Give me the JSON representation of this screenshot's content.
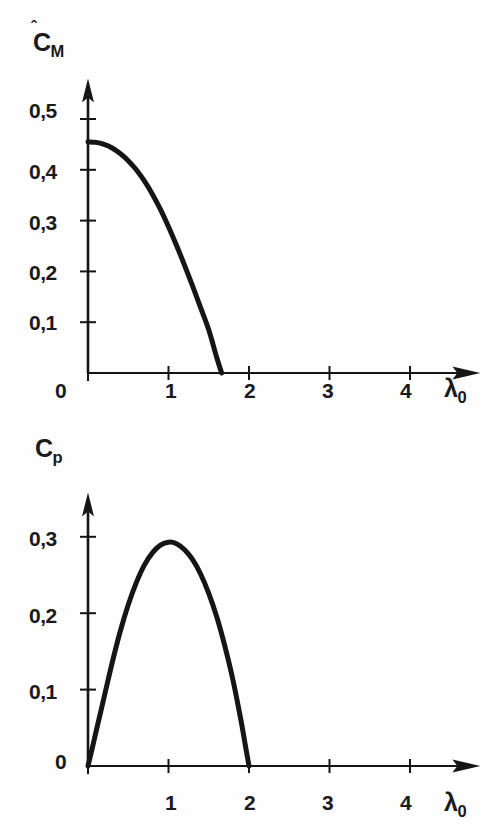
{
  "figure": {
    "background_color": "#fefefe",
    "ink_color": "#151515",
    "panels": [
      "top",
      "bottom"
    ]
  },
  "chart_data": [
    {
      "id": "top",
      "type": "line",
      "title": "",
      "subtitle": "",
      "xlabel": "λ₀",
      "ylabel": "Ĉₘ",
      "ylabel_base": "C",
      "ylabel_sub": "M",
      "ylabel_has_hat": true,
      "xlabel_base": "λ",
      "xlabel_sub": "0",
      "xlim": [
        0,
        4.75
      ],
      "ylim": [
        0,
        0.56
      ],
      "xticks": [
        0,
        1,
        2,
        3,
        4
      ],
      "xtick_labels": [
        "0",
        "1",
        "2",
        "3",
        "4"
      ],
      "yticks": [
        0.1,
        0.2,
        0.3,
        0.4,
        0.5
      ],
      "ytick_labels": [
        "0,1",
        "0,2",
        "0,3",
        "0,4",
        "0,5"
      ],
      "y_origin_label": "0",
      "grid": false,
      "legend": "none",
      "axis_arrows": true,
      "series": [
        {
          "name": "C_M",
          "x": [
            0.0,
            0.1,
            0.2,
            0.3,
            0.4,
            0.5,
            0.6,
            0.7,
            0.8,
            0.9,
            1.0,
            1.1,
            1.2,
            1.3,
            1.4,
            1.5,
            1.6,
            1.66
          ],
          "values": [
            0.455,
            0.454,
            0.45,
            0.443,
            0.432,
            0.418,
            0.4,
            0.378,
            0.352,
            0.322,
            0.288,
            0.251,
            0.212,
            0.171,
            0.128,
            0.085,
            0.03,
            0.0
          ]
        }
      ]
    },
    {
      "id": "bottom",
      "type": "line",
      "title": "",
      "subtitle": "",
      "xlabel": "λ₀",
      "ylabel": "Cₚ",
      "ylabel_base": "C",
      "ylabel_sub": "p",
      "ylabel_has_hat": false,
      "xlabel_base": "λ",
      "xlabel_sub": "0",
      "xlim": [
        0,
        4.75
      ],
      "ylim": [
        0,
        0.345
      ],
      "xticks": [
        0,
        1,
        2,
        3,
        4
      ],
      "xtick_labels": [
        "0",
        "1",
        "2",
        "3",
        "4"
      ],
      "yticks": [
        0.1,
        0.2,
        0.3
      ],
      "ytick_labels": [
        "0,1",
        "0,2",
        "0,3"
      ],
      "y_origin_label": "0",
      "grid": false,
      "legend": "none",
      "axis_arrows": true,
      "series": [
        {
          "name": "C_p",
          "x": [
            0.0,
            0.05,
            0.1,
            0.2,
            0.3,
            0.4,
            0.5,
            0.6,
            0.7,
            0.8,
            0.9,
            1.0,
            1.1,
            1.2,
            1.3,
            1.4,
            1.5,
            1.6,
            1.7,
            1.8,
            1.9,
            1.95,
            2.0
          ],
          "values": [
            0.0,
            0.022,
            0.045,
            0.09,
            0.135,
            0.176,
            0.211,
            0.24,
            0.263,
            0.279,
            0.289,
            0.293,
            0.291,
            0.283,
            0.27,
            0.251,
            0.226,
            0.195,
            0.157,
            0.113,
            0.06,
            0.03,
            0.0
          ]
        }
      ]
    }
  ]
}
